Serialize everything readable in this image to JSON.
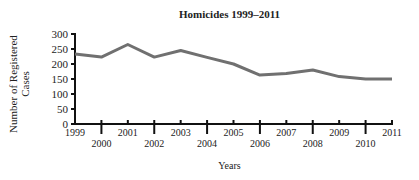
{
  "chart_data": {
    "type": "line",
    "title": "Homicides 1999–2011",
    "xlabel": "Years",
    "ylabel": "Number of Registered Cases",
    "ylabel_lines": [
      "Number of Registered",
      "Cases"
    ],
    "x": [
      1999,
      2000,
      2001,
      2002,
      2003,
      2004,
      2005,
      2006,
      2007,
      2008,
      2009,
      2010,
      2011
    ],
    "series": [
      {
        "name": "Homicides",
        "color": "#707070",
        "values": [
          233,
          223,
          265,
          223,
          245,
          222,
          200,
          163,
          168,
          180,
          158,
          150,
          150
        ]
      }
    ],
    "ylim": [
      0,
      300
    ],
    "yticks": [
      0,
      50,
      100,
      150,
      200,
      250,
      300
    ],
    "xticks_upper": [
      "1999",
      "2001",
      "2003",
      "2005",
      "2007",
      "2009",
      "2011"
    ],
    "xticks_lower": [
      "2000",
      "2002",
      "2004",
      "2006",
      "2008",
      "2010"
    ],
    "grid": false,
    "legend": "none"
  }
}
